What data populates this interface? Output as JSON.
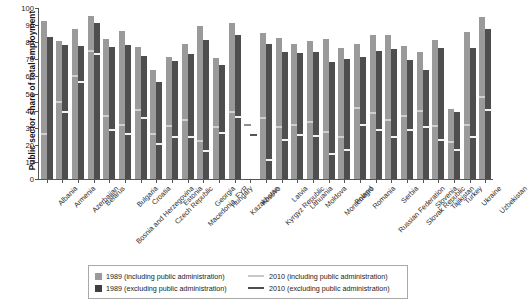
{
  "chart_data": {
    "type": "bar",
    "title": "",
    "xlabel": "",
    "ylabel": "Public sector share of total employment",
    "ylim": [
      0,
      100
    ],
    "yticks": [
      0,
      10,
      20,
      30,
      40,
      50,
      60,
      70,
      80,
      90,
      100
    ],
    "grid": false,
    "legend_position": "bottom",
    "categories": [
      "Albania",
      "Armenia",
      "Azerbaijan",
      "Belarus",
      "Bosnia and Herzegovina",
      "Bulgaria",
      "Croatia",
      "Czech Republic",
      "Estonia",
      "Macedonia, FYR",
      "Georgia",
      "Hungary",
      "Kazakhstan",
      "Kosovo",
      "Kyrgyz Republic",
      "Latvia",
      "Lithuania",
      "Moldova",
      "Montenegro",
      "Poland",
      "Romania",
      "Russian Federation",
      "Serbia",
      "Slovak Republic",
      "Slovenia",
      "Tajikistan",
      "Turkey",
      "Ukraine",
      "Uzbekistan"
    ],
    "series": [
      {
        "name": "1989 (including public administration)",
        "type": "bar",
        "color": "#9a9a9a",
        "values": [
          92.5,
          81.0,
          87.5,
          95.5,
          82.0,
          86.5,
          77.0,
          63.5,
          71.5,
          79.0,
          89.5,
          70.5,
          91.5,
          null,
          85.5,
          82.5,
          79.0,
          80.5,
          82.0,
          76.5,
          79.0,
          84.0,
          84.0,
          78.0,
          74.5,
          81.5,
          41.0,
          86.0,
          95.0
        ]
      },
      {
        "name": "1989 (excluding public administration)",
        "type": "bar",
        "color": "#4e4e4e",
        "values": [
          83.0,
          78.5,
          77.5,
          91.0,
          77.0,
          78.5,
          72.0,
          57.0,
          69.0,
          73.0,
          81.5,
          66.5,
          84.5,
          null,
          79.0,
          74.0,
          73.5,
          74.0,
          68.5,
          70.0,
          71.5,
          75.0,
          76.0,
          69.5,
          64.0,
          76.5,
          39.0,
          76.5,
          87.5
        ]
      },
      {
        "name": "2010 (including public administration)",
        "type": "marker",
        "color": "#cfcfcf",
        "values": [
          26.0,
          44.5,
          59.5,
          74.0,
          36.0,
          31.0,
          40.0,
          26.0,
          30.5,
          34.0,
          21.5,
          30.0,
          38.5,
          31.0,
          35.0,
          30.0,
          31.0,
          33.0,
          27.0,
          24.0,
          41.0,
          38.0,
          34.0,
          36.0,
          39.0,
          30.5,
          21.0,
          31.0,
          47.5
        ]
      },
      {
        "name": "2010 (excluding public administration)",
        "type": "marker",
        "color": "#4e4e4e",
        "values": [
          null,
          38.5,
          56.0,
          72.5,
          28.0,
          26.0,
          35.0,
          20.0,
          24.0,
          24.0,
          16.0,
          26.5,
          35.5,
          25.0,
          10.5,
          22.0,
          25.0,
          24.5,
          14.0,
          16.5,
          31.0,
          28.0,
          24.0,
          28.0,
          30.0,
          22.0,
          16.5,
          24.0,
          40.0
        ]
      }
    ],
    "legend": [
      "1989 (including public administration)",
      "2010 (including public administration)",
      "1989 (excluding public administration)",
      "2010 (excluding public administration)"
    ]
  },
  "colors": {
    "bar_including_1989": "#9a9a9a",
    "bar_excluding_1989": "#4e4e4e",
    "marker_including_2010": "#cfcfcf",
    "marker_excluding_2010": "#4e4e4e",
    "axis": "#555555",
    "background": "#ffffff"
  }
}
